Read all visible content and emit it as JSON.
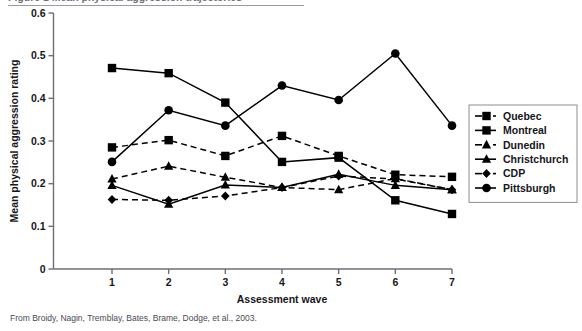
{
  "figure": {
    "header_text": "Figure 1  Mean physical aggression trajectories",
    "caption": "From Broidy, Nagin, Tremblay, Bates, Brame, Dodge, et al., 2003."
  },
  "chart_data": {
    "type": "line",
    "title": "",
    "xlabel": "Assessment wave",
    "ylabel": "Mean physical aggression rating",
    "x": [
      1,
      2,
      3,
      4,
      5,
      6,
      7
    ],
    "xtick_labels": [
      "1",
      "2",
      "3",
      "4",
      "5",
      "6",
      "7"
    ],
    "ytick_labels": [
      "0",
      "0.1",
      "0.2",
      "0.3",
      "0.4",
      "0.5",
      "0.6"
    ],
    "ytick_values": [
      0,
      0.1,
      0.2,
      0.3,
      0.4,
      0.5,
      0.6
    ],
    "xlim": [
      0.5,
      7.5
    ],
    "ylim": [
      0,
      0.6
    ],
    "grid": false,
    "legend_position": "right",
    "series": [
      {
        "name": "Quebec",
        "marker": "square",
        "line": "dashed",
        "color": "#000000",
        "values": [
          0.285,
          0.302,
          0.265,
          0.312,
          0.265,
          0.221,
          0.216
        ]
      },
      {
        "name": "Montreal",
        "marker": "square",
        "line": "solid",
        "color": "#000000",
        "values": [
          0.471,
          0.459,
          0.39,
          0.251,
          0.261,
          0.161,
          0.129
        ]
      },
      {
        "name": "Dunedin",
        "marker": "triangle",
        "line": "dashed",
        "color": "#000000",
        "values": [
          0.211,
          0.241,
          0.215,
          0.191,
          0.186,
          0.212,
          0.186
        ]
      },
      {
        "name": "Christchurch",
        "marker": "triangle",
        "line": "solid",
        "color": "#000000",
        "values": [
          0.196,
          0.152,
          0.197,
          0.191,
          0.222,
          0.196,
          0.186
        ]
      },
      {
        "name": "CDP",
        "marker": "diamond",
        "line": "dashed",
        "color": "#000000",
        "values": [
          0.163,
          0.161,
          0.171,
          0.191,
          0.218,
          0.211,
          0.186
        ]
      },
      {
        "name": "Pittsburgh",
        "marker": "circle",
        "line": "solid",
        "color": "#000000",
        "values": [
          0.251,
          0.372,
          0.336,
          0.43,
          0.396,
          0.505,
          0.336
        ]
      }
    ]
  }
}
